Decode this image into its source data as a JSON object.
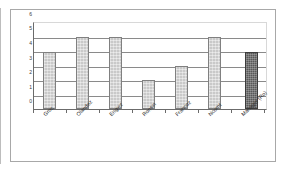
{
  "chart_data": {
    "type": "bar",
    "title": "",
    "subtitle": "",
    "xlabel": "",
    "ylabel": "",
    "ylim": [
      0,
      6
    ],
    "yticks": [
      "0",
      "1",
      "2",
      "3",
      "4",
      "5",
      "6"
    ],
    "grid": true,
    "legend": false,
    "legend_position": "none",
    "categories": [
      "Groc",
      "Olandez",
      "Engiez",
      "Ronsin",
      "Francoz",
      "Ncornt",
      "Manager (Ro)"
    ],
    "values": [
      4,
      5,
      5,
      2,
      3,
      5,
      4
    ],
    "bar_styles": [
      "light",
      "light",
      "light",
      "light",
      "light",
      "light",
      "dark"
    ],
    "colors": {
      "bar_light_fill": "#c9c9c9",
      "bar_light_border": "#808080",
      "bar_dark_fill": "#585858",
      "bar_dark_border": "#3c3c3c",
      "gridline": "#8a8a8a",
      "axis": "#6b6b6b",
      "frame": "#a8a8a8",
      "background": "#ffffff",
      "text": "#2e2e2e"
    }
  }
}
